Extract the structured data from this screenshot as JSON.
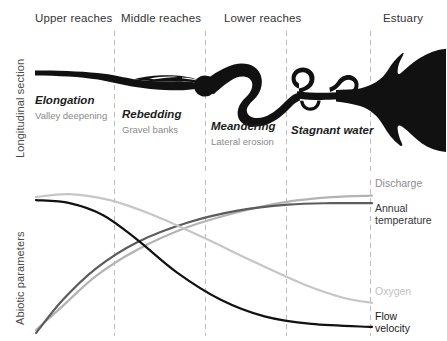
{
  "axes": {
    "top_axis_label": "Longitudinal section",
    "bottom_axis_label": "Abiotic parameters"
  },
  "zones": [
    {
      "name": "upper-reaches",
      "label": "Upper reaches"
    },
    {
      "name": "middle-reaches",
      "label": "Middle reaches"
    },
    {
      "name": "lower-reaches",
      "label": "Lower reaches"
    },
    {
      "name": "estuary",
      "label": "Estuary"
    }
  ],
  "processes": [
    {
      "title": "Elongation",
      "subtitle": "Valley deepening"
    },
    {
      "title": "Rebedding",
      "subtitle": "Gravel banks"
    },
    {
      "title": "Meandering",
      "subtitle": "Lateral erosion"
    },
    {
      "title": "Stagnant water",
      "subtitle": ""
    }
  ],
  "colors": {
    "river_fill": "#111111",
    "divider": "#bcbcbc",
    "discharge": "#b3b3b3",
    "annual_temperature": "#5c5c5c",
    "oxygen": "#c6c6c6",
    "flow_velocity": "#111111",
    "zone_label": "#343434",
    "subtitle": "#8a8a8a"
  },
  "chart_data": {
    "type": "line",
    "title": "",
    "xlabel": "",
    "ylabel": "Abiotic parameters",
    "x": [
      "Upper reaches",
      "Middle reaches",
      "Lower reaches",
      "Estuary"
    ],
    "xlim": [
      0,
      100
    ],
    "ylim": [
      0,
      100
    ],
    "grid": false,
    "legend_position": "right",
    "annotations": [
      "Vertical dashed dividers separate Upper / Middle / Lower reaches and Estuary"
    ],
    "series": [
      {
        "name": "Discharge",
        "label": "Discharge",
        "color": "#b3b3b3",
        "points": [
          [
            0,
            2
          ],
          [
            8,
            18
          ],
          [
            18,
            38
          ],
          [
            30,
            55
          ],
          [
            45,
            70
          ],
          [
            60,
            80
          ],
          [
            75,
            87
          ],
          [
            88,
            90
          ],
          [
            100,
            91
          ]
        ]
      },
      {
        "name": "Annual temperature",
        "label": "Annual\ntemperature",
        "color": "#5c5c5c",
        "points": [
          [
            0,
            0
          ],
          [
            8,
            22
          ],
          [
            18,
            43
          ],
          [
            30,
            60
          ],
          [
            45,
            73
          ],
          [
            60,
            81
          ],
          [
            75,
            85
          ],
          [
            88,
            86
          ],
          [
            100,
            86
          ]
        ]
      },
      {
        "name": "Oxygen",
        "label": "Oxygen",
        "color": "#c6c6c6",
        "points": [
          [
            0,
            90
          ],
          [
            10,
            92
          ],
          [
            22,
            88
          ],
          [
            35,
            78
          ],
          [
            50,
            63
          ],
          [
            65,
            47
          ],
          [
            80,
            32
          ],
          [
            92,
            23
          ],
          [
            100,
            20
          ]
        ]
      },
      {
        "name": "Flow velocity",
        "label": "Flow\nvelocity",
        "color": "#111111",
        "points": [
          [
            0,
            88
          ],
          [
            10,
            86
          ],
          [
            20,
            78
          ],
          [
            30,
            62
          ],
          [
            42,
            40
          ],
          [
            55,
            22
          ],
          [
            68,
            11
          ],
          [
            82,
            6
          ],
          [
            100,
            4
          ]
        ]
      }
    ]
  }
}
